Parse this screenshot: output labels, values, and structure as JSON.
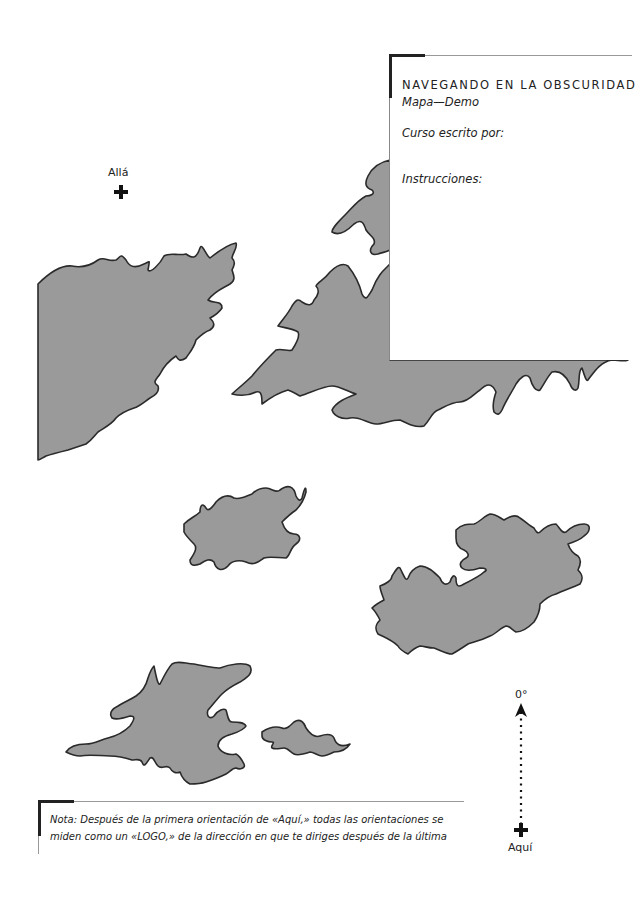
{
  "card": {
    "title": "NAVEGANDO EN LA OBSCURIDAD",
    "subtitle": "Mapa—Demo",
    "author_label": "Curso escrito por:",
    "instructions_label": "Instrucciones:"
  },
  "markers": {
    "alla": {
      "label": "Allá",
      "icon": "cross-icon"
    },
    "aqui": {
      "label": "Aquí",
      "icon": "cross-icon"
    }
  },
  "compass": {
    "bearing_label": "0°",
    "icon": "arrow-up-icon"
  },
  "note": {
    "text": "Nota: Después de la primera orientación de «Aquí,» todas las orientaciones se miden como un «LOGO,» de la dirección en que te diriges después de la última"
  },
  "colors": {
    "land": "#9a9a9a",
    "outline": "#2a2a2a",
    "background": "#ffffff"
  }
}
